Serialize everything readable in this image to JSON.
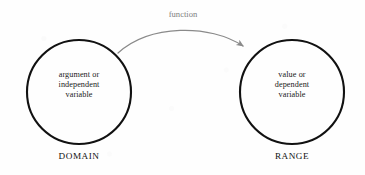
{
  "figure": {
    "background_color": "#fefefe",
    "stroke_color": "#111111",
    "arrow_color": "#8a8a8a",
    "text_color": "#1a1a1a",
    "label_color": "#7e7e7e"
  },
  "edge": {
    "label": "function"
  },
  "domain": {
    "caption": "DOMAIN",
    "lines": [
      "argument or",
      "independent",
      "variable"
    ]
  },
  "range": {
    "caption": "RANGE",
    "lines": [
      "value or",
      "dependent",
      "variable"
    ]
  }
}
